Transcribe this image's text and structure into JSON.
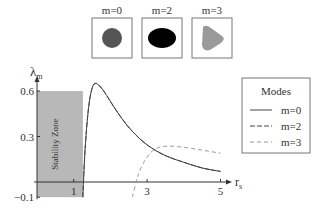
{
  "insets": [
    {
      "label": "m=0",
      "shape": "circle",
      "color": "#555555"
    },
    {
      "label": "m=2",
      "shape": "ellipse",
      "color": "#000000"
    },
    {
      "label": "m=3",
      "shape": "rounded-triangle",
      "color": "#9a9a9a"
    }
  ],
  "chart_data": {
    "type": "line",
    "title": "",
    "xlabel": "r",
    "xlabel_sub": "s",
    "ylabel": "λ",
    "ylabel_sub": "m",
    "xlim": [
      0,
      5.1
    ],
    "ylim": [
      -0.1,
      0.65
    ],
    "xticks": [
      {
        "v": 1,
        "label": "1"
      },
      {
        "v": 3,
        "label": "3"
      },
      {
        "v": 5,
        "label": "5"
      }
    ],
    "yticks": [
      {
        "v": 0.6,
        "label": "0.6"
      },
      {
        "v": 0.3,
        "label": "0.3"
      },
      {
        "v": -0.1,
        "label": "−0.1"
      }
    ],
    "shaded_region": {
      "label": "Stability Zone",
      "x": [
        0,
        1.25
      ],
      "y": [
        -0.1,
        0.6
      ],
      "color": "#b8b8b8"
    },
    "legend": {
      "title": "Modes",
      "position": "right"
    },
    "series": [
      {
        "name": "m=0",
        "style": "solid",
        "color": "#444444",
        "x": [
          1.25,
          1.3,
          1.4,
          1.5,
          1.6,
          1.8,
          2.0,
          2.3,
          2.6,
          3.0,
          3.5,
          4.0,
          4.5,
          5.0
        ],
        "y": [
          -0.1,
          0.2,
          0.5,
          0.63,
          0.66,
          0.61,
          0.53,
          0.42,
          0.33,
          0.24,
          0.17,
          0.13,
          0.09,
          0.07
        ]
      },
      {
        "name": "m=2",
        "style": "dashed",
        "color": "#444444",
        "x": [
          1.25,
          1.3,
          1.4,
          1.5,
          1.6,
          1.8,
          2.0,
          2.3,
          2.6,
          3.0,
          3.5,
          4.0,
          4.5,
          5.0
        ],
        "y": [
          -0.1,
          0.2,
          0.5,
          0.63,
          0.66,
          0.61,
          0.53,
          0.42,
          0.33,
          0.24,
          0.17,
          0.13,
          0.09,
          0.07
        ]
      },
      {
        "name": "m=3",
        "style": "dashed",
        "color": "#999999",
        "x": [
          2.6,
          2.7,
          2.8,
          3.0,
          3.2,
          3.5,
          4.0,
          4.5,
          5.0
        ],
        "y": [
          -0.1,
          0.0,
          0.08,
          0.17,
          0.22,
          0.24,
          0.23,
          0.21,
          0.19
        ]
      }
    ]
  }
}
